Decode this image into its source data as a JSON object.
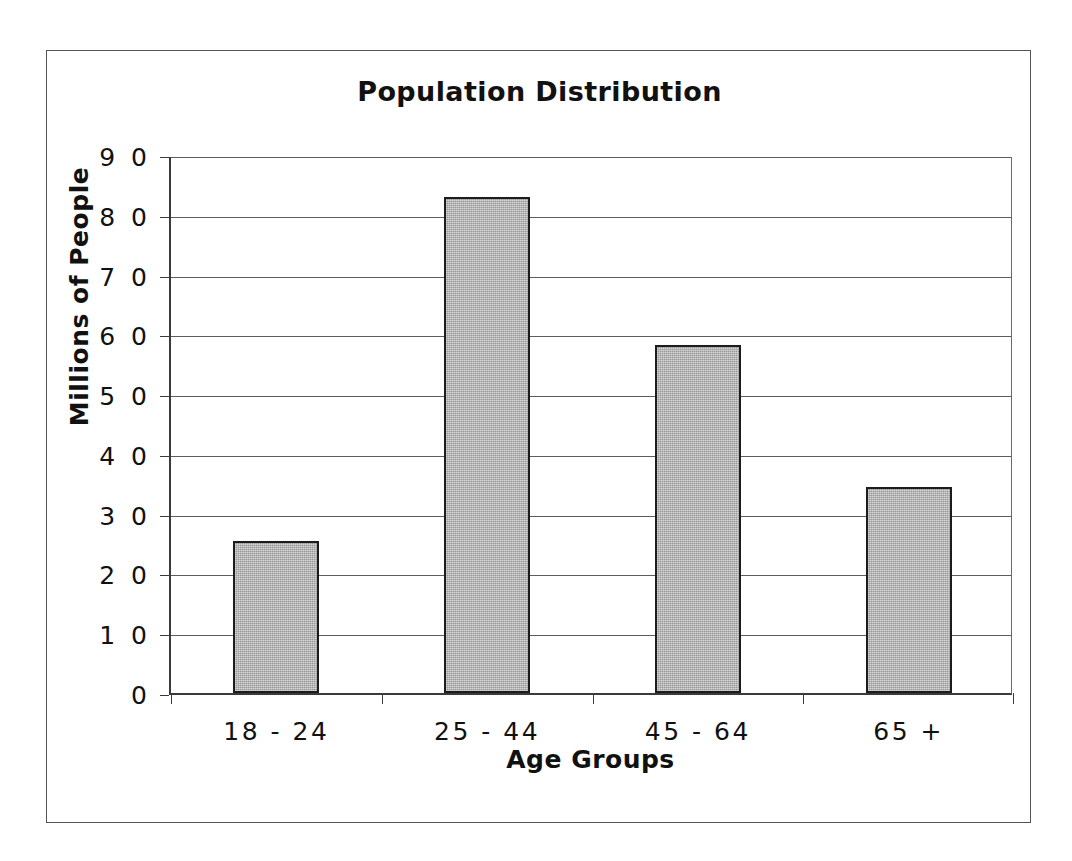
{
  "figure": {
    "background_color": "#ffffff",
    "frame_color": "#555555"
  },
  "chart_data": {
    "type": "bar",
    "title": "Population Distribution",
    "xlabel": "Age Groups",
    "ylabel": "Millions of People",
    "categories": [
      "18 - 24",
      "25 - 44",
      "45 - 64",
      "65 +"
    ],
    "values": [
      25.5,
      83,
      58.3,
      34.5
    ],
    "ylim": [
      0,
      90
    ],
    "ytick_labels": [
      "0",
      "1 0",
      "2 0",
      "3 0",
      "4 0",
      "5 0",
      "6 0",
      "7 0",
      "8 0",
      "9 0"
    ],
    "ytick_values": [
      0,
      10,
      20,
      30,
      40,
      50,
      60,
      70,
      80,
      90
    ],
    "ytick_step": 10,
    "grid": "horizontal",
    "legend": "none",
    "bar_fill_color": "#ababab",
    "bar_edge_color": "#1c1c1c",
    "gridline_color": "#5c5c5c",
    "axis_color": "#3a3a3a"
  }
}
